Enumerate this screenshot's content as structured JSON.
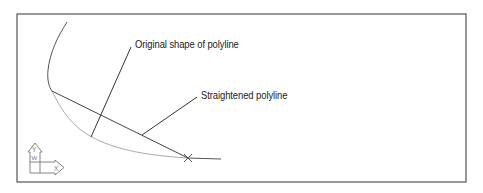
{
  "diagram": {
    "type": "cad-polyline-illustration",
    "labels": {
      "original": "Original shape of polyline",
      "straightened": "Straightened polyline"
    },
    "ucs_icon": {
      "y_axis": "Y",
      "x_axis": "X",
      "world": "W"
    },
    "colors": {
      "frame": "#555555",
      "straight_line": "#444444",
      "original_curve": "#aaaaaa",
      "leader": "#333333",
      "text": "#222222",
      "background": "#ffffff"
    }
  }
}
